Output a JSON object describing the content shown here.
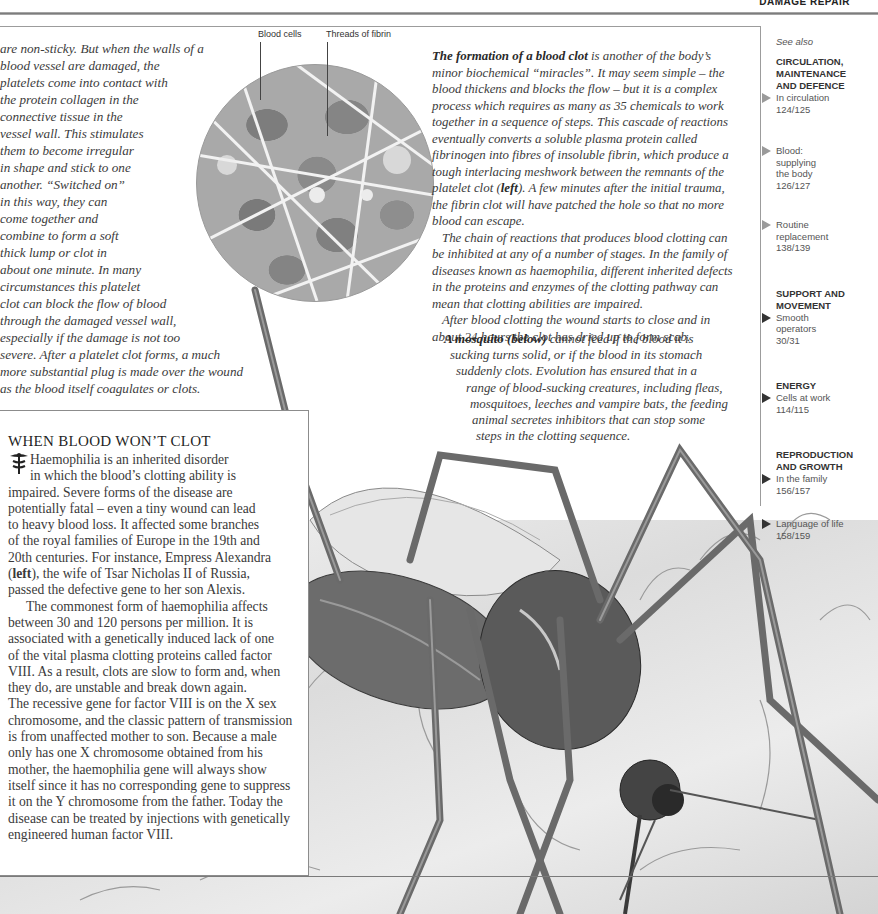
{
  "header": {
    "title": "DAMAGE REPAIR"
  },
  "intro": {
    "lines": [
      "are non-sticky. But when the walls of a",
      "blood vessel are damaged, the",
      "platelets come into contact with",
      "the protein collagen in the",
      "connective tissue in the",
      "vessel wall. This stimulates",
      "them to become irregular",
      "in shape and stick to one",
      "another. “Switched on”",
      "in this way, they can",
      "come together and",
      "combine to form a soft",
      "thick lump or clot in",
      "about one minute. In many",
      "circumstances this platelet",
      "clot can block the flow of blood",
      "through the damaged vessel wall,",
      "especially if the damage is not too",
      "severe. After a platelet clot forms, a much",
      "more substantial plug is made over the wound",
      "as the blood itself coagulates or clots."
    ]
  },
  "figure": {
    "labels": {
      "blood_cells": "Blood cells",
      "fibrin": "Threads of fibrin"
    }
  },
  "main": {
    "formation": {
      "lead": "The formation of a blood clot",
      "lines": [
        " is another of the body’s",
        "minor biochemical “miracles”. It may seem simple – the",
        "blood thickens and blocks the flow – but it is a complex",
        "process which requires as many as 35 chemicals to work",
        "together in a sequence of steps. This cascade of reactions",
        "eventually converts a soluble plasma protein called",
        "fibrinogen into fibres of insoluble fibrin, which produce a",
        "tough interlacing meshwork between the remnants of the"
      ],
      "left_line_pre": "platelet clot (",
      "left_word": "left",
      "left_line_post": "). A few minutes after the initial trauma,",
      "lines_after": [
        "the fibrin clot will have patched the hole so that no more",
        "blood can escape."
      ]
    },
    "chain_lines": [
      "The chain of reactions that produces blood clotting can",
      "be inhibited at any of a number of stages. In the family of",
      "diseases known as haemophilia, different inherited defects",
      "in the proteins and enzymes of the clotting pathway can",
      "mean that clotting abilities are impaired."
    ],
    "after_lines": [
      "After blood clotting the wound starts to close and in",
      "about 24 hours the clot has dried up to form scab."
    ]
  },
  "mosquito_caption": {
    "lead": "A mosquito (below)",
    "first_line_rest": " cannot feed if the blood it is",
    "lines": [
      "sucking turns solid, or if the blood in its stomach",
      "suddenly clots. Evolution has ensured that in a",
      "range of blood-sucking creatures, including fleas,",
      "mosquitoes, leeches and vampire bats, the feeding",
      "animal secretes inhibitors that can stop some",
      "steps in the clotting sequence."
    ]
  },
  "sidebar": {
    "title": "WHEN BLOOD WON’T CLOT",
    "icon": "caduceus-icon",
    "p1_lines": [
      "Haemophilia is an inherited disorder",
      "in which the blood’s clotting ability is",
      "impaired. Severe forms of the disease are",
      "potentially fatal – even a tiny wound can lead",
      "to heavy blood loss. It affected some branches",
      "of the royal families of Europe in the 19th and",
      "20th centuries. For instance, Empress Alexandra"
    ],
    "p1_left_pre": "(",
    "p1_left_word": "left",
    "p1_left_post": "), the wife of Tsar Nicholas II of Russia,",
    "p1_last": "passed the defective gene to her son Alexis.",
    "p2_lines": [
      "The commonest form of haemophilia affects",
      "between 30 and 120 persons per million. It is",
      "associated with a genetically induced lack of one",
      "of the vital plasma clotting proteins called factor",
      "VIII. As a result, clots are slow to form and, when",
      "they do, are unstable and break down again.",
      "The recessive gene for factor VIII is on the X sex",
      "chromosome, and the classic pattern of transmission",
      "is from unaffected mother to son. Because a male",
      "only has one X chromosome obtained from his",
      "mother, the haemophilia gene will always show",
      "itself since it has no corresponding gene to suppress",
      "it on the Y chromosome from the father. Today the",
      "disease can be treated by injections with genetically",
      "engineered human factor VIII."
    ]
  },
  "see_also": {
    "label": "See also",
    "sections": [
      {
        "title_lines": [
          "CIRCULATION,",
          "MAINTENANCE",
          "AND DEFENCE"
        ],
        "links": [
          {
            "lines": [
              "In circulation",
              "124/125"
            ]
          },
          {
            "lines": [
              "Blood:",
              "supplying",
              "the body",
              "126/127"
            ]
          },
          {
            "lines": [
              "Routine",
              "replacement",
              "138/139"
            ]
          }
        ]
      },
      {
        "title_lines": [
          "SUPPORT AND",
          "MOVEMENT"
        ],
        "links": [
          {
            "lines": [
              "Smooth",
              "operators",
              "30/31"
            ]
          }
        ]
      },
      {
        "title_lines": [
          "ENERGY"
        ],
        "links": [
          {
            "lines": [
              "Cells at work",
              "114/115"
            ]
          }
        ]
      },
      {
        "title_lines": [
          "REPRODUCTION",
          "AND GROWTH"
        ],
        "links": [
          {
            "lines": [
              "In the family",
              "156/157"
            ]
          },
          {
            "lines": [
              "Language of life",
              "158/159"
            ]
          }
        ]
      }
    ]
  },
  "colors": {
    "text": "#3a3a3a",
    "rule": "#8c8c8c",
    "arrow_light": "#9a9a9a",
    "arrow_dark": "#333333"
  }
}
